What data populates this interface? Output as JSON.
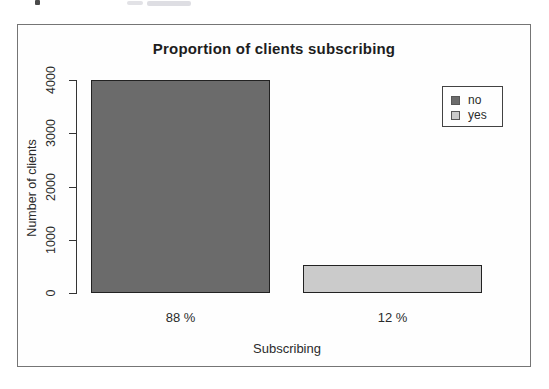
{
  "page": {
    "background": "#ffffff",
    "frame_border_color": "#757575"
  },
  "chart": {
    "title": "Proportion of clients subscribing",
    "x_axis_label": "Subscribing",
    "y_axis_label": "Number of clients"
  },
  "chart_data": {
    "type": "bar",
    "title": "Proportion of clients subscribing",
    "xlabel": "Subscribing",
    "ylabel": "Number of clients",
    "categories": [
      "no",
      "yes"
    ],
    "values": [
      4000,
      520
    ],
    "bar_value_labels": [
      "88 %",
      "12 %"
    ],
    "colors": [
      "#6b6b6b",
      "#cbcbcb"
    ],
    "ylim": [
      0,
      4000
    ],
    "yticks": [
      0,
      1000,
      2000,
      3000,
      4000
    ],
    "grid": false,
    "legend": {
      "position": "top-right",
      "entries": [
        {
          "label": "no",
          "color": "#6b6b6b"
        },
        {
          "label": "yes",
          "color": "#cbcbcb"
        }
      ]
    }
  }
}
